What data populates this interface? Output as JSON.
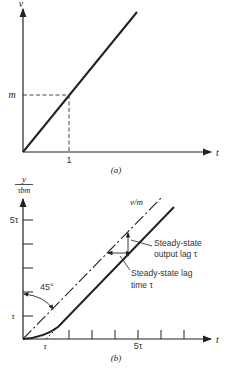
{
  "figure_a": {
    "y_axis_label": "v",
    "x_axis_label": "t",
    "y_marker_label": "m",
    "x_marker_label": "1",
    "caption": "(a)",
    "description": "Ramp input v = m t"
  },
  "figure_b": {
    "y_axis_label_numerator": "y",
    "y_axis_label_denominator": "τbm",
    "x_axis_label": "t",
    "y_tick_labels": {
      "tau": "τ",
      "five_tau": "5τ"
    },
    "x_tick_labels": {
      "tau": "τ",
      "five_tau": "5τ"
    },
    "angle_label": "45°",
    "dashed_line_label": "v/m",
    "annotation_output_lag": [
      "Steady-state",
      "output lag τ"
    ],
    "annotation_lag_time": [
      "Steady-state lag",
      "time τ"
    ],
    "caption": "(b)",
    "x_tick_count": 6,
    "y_tick_count": 5
  }
}
